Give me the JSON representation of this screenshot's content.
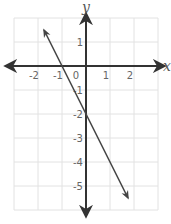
{
  "chart_data": {
    "type": "line",
    "title": "",
    "xlabel": "x",
    "ylabel": "y",
    "xlim": [
      -3,
      3
    ],
    "ylim": [
      -6,
      2
    ],
    "grid": true,
    "x_ticks": [
      -2,
      -1,
      0,
      1,
      2
    ],
    "x_tick_labels": [
      "-2",
      "-1",
      "0",
      "1",
      "2"
    ],
    "y_ticks": [
      1,
      -1,
      -2,
      -3,
      -4,
      -5
    ],
    "y_tick_labels": [
      "1",
      "-1",
      "-2",
      "-3",
      "-4",
      "-5"
    ],
    "series": [
      {
        "name": "y = -2x - 2",
        "equation": "y = -2x - 2",
        "x": [
          -1.75,
          1.75
        ],
        "y": [
          1.5,
          -5.5
        ],
        "arrows": "both"
      }
    ],
    "colors": {
      "grid": "#e2e2e2",
      "axis": "#333333",
      "line": "#444444"
    }
  }
}
